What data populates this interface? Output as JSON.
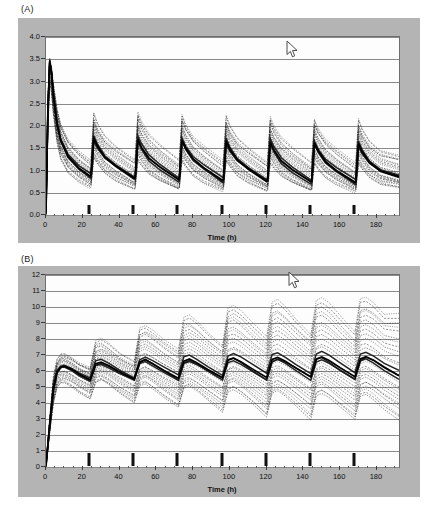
{
  "figure": {
    "background_color": "#ffffff",
    "panel_background_color": "#b4b4b4",
    "plot_background_color": "#fdfdfd",
    "grid_color": "#8a8a8a",
    "curve_color": "#1a1a1a"
  },
  "panels": {
    "a": {
      "letter": "(A)",
      "cursor": {
        "name": "mouse-pointer",
        "x": 286,
        "y": 40
      }
    },
    "b": {
      "letter": "(B)",
      "cursor": {
        "name": "mouse-pointer",
        "x": 288,
        "y": 271
      }
    }
  },
  "chart_data": [
    {
      "type": "line",
      "panel": "(A)",
      "title": "",
      "xlabel": "Time (h)",
      "ylabel": "",
      "xlim": [
        0,
        192
      ],
      "ylim": [
        0.0,
        4.0
      ],
      "xticks": [
        0,
        20,
        40,
        60,
        80,
        100,
        120,
        140,
        160,
        180
      ],
      "xticklabels": [
        "0",
        "20",
        "40",
        "60",
        "80",
        "100",
        "120",
        "140",
        "160",
        "180"
      ],
      "yticks": [
        0.0,
        0.5,
        1.0,
        1.5,
        2.0,
        2.5,
        3.0,
        3.5,
        4.0
      ],
      "yticklabels": [
        "0.0",
        "0.5",
        "1.0",
        "1.5",
        "2.0",
        "2.5",
        "3.0",
        "3.5",
        "4.0"
      ],
      "grid": true,
      "legend": "none",
      "dose_times": [
        24,
        48,
        72,
        96,
        120,
        144,
        168
      ],
      "description": "Spaghetti plot of simulated plasma concentration-time profiles; loading-dose peak near 3.5 then repeated peaks ~2.0-2.3 decaying toward 0.5-0.8 troughs.",
      "series": [
        {
          "name": "median",
          "style": "solid",
          "x": [
            0,
            1,
            2,
            3,
            4,
            6,
            8,
            12,
            18,
            24,
            24.5,
            26,
            28,
            32,
            38,
            48,
            48.5,
            50,
            52,
            56,
            62,
            72,
            72.5,
            74,
            76,
            80,
            86,
            96,
            96.5,
            98,
            100,
            104,
            110,
            120,
            120.5,
            122,
            124,
            128,
            134,
            144,
            144.5,
            146,
            148,
            152,
            158,
            168,
            168.5,
            170,
            172,
            176,
            182,
            192
          ],
          "y": [
            0.05,
            2.3,
            3.45,
            3.2,
            2.7,
            2.05,
            1.68,
            1.32,
            1.05,
            0.88,
            0.9,
            1.72,
            1.55,
            1.3,
            1.1,
            0.82,
            0.84,
            1.7,
            1.52,
            1.28,
            1.08,
            0.8,
            0.82,
            1.68,
            1.5,
            1.26,
            1.06,
            0.78,
            0.8,
            1.66,
            1.48,
            1.24,
            1.04,
            0.76,
            0.78,
            1.64,
            1.46,
            1.22,
            1.02,
            0.75,
            0.77,
            1.62,
            1.44,
            1.2,
            1.0,
            0.74,
            0.76,
            1.6,
            1.42,
            1.18,
            0.99,
            0.86
          ]
        },
        {
          "name": "upper-band",
          "style": "dashed",
          "x": [
            0,
            1,
            2,
            3,
            4,
            6,
            8,
            12,
            18,
            24,
            24.5,
            26,
            28,
            32,
            38,
            48,
            48.5,
            50,
            52,
            56,
            62,
            72,
            72.5,
            74,
            76,
            80,
            86,
            96,
            96.5,
            98,
            100,
            104,
            110,
            120,
            120.5,
            122,
            124,
            128,
            134,
            144,
            144.5,
            146,
            148,
            152,
            158,
            168,
            168.5,
            170,
            172,
            176,
            182,
            192
          ],
          "y": [
            0.07,
            2.6,
            3.5,
            3.3,
            2.95,
            2.4,
            2.05,
            1.7,
            1.42,
            1.22,
            1.24,
            2.28,
            2.05,
            1.78,
            1.55,
            1.26,
            1.28,
            2.3,
            2.08,
            1.8,
            1.56,
            1.24,
            1.26,
            2.26,
            2.04,
            1.76,
            1.54,
            1.22,
            1.24,
            2.22,
            2.0,
            1.74,
            1.52,
            1.2,
            1.22,
            2.2,
            1.98,
            1.72,
            1.5,
            1.18,
            1.2,
            2.16,
            1.95,
            1.7,
            1.48,
            1.16,
            1.18,
            2.14,
            1.92,
            1.66,
            1.45,
            1.35
          ]
        },
        {
          "name": "lower-band",
          "style": "dashed",
          "x": [
            0,
            1,
            2,
            3,
            4,
            6,
            8,
            12,
            18,
            24,
            24.5,
            26,
            28,
            32,
            38,
            48,
            48.5,
            50,
            52,
            56,
            62,
            72,
            72.5,
            74,
            76,
            80,
            86,
            96,
            96.5,
            98,
            100,
            104,
            110,
            120,
            120.5,
            122,
            124,
            128,
            134,
            144,
            144.5,
            146,
            148,
            152,
            158,
            168,
            168.5,
            170,
            172,
            176,
            182,
            192
          ],
          "y": [
            0.03,
            1.8,
            2.95,
            2.7,
            2.25,
            1.62,
            1.25,
            0.95,
            0.75,
            0.62,
            0.64,
            1.25,
            1.12,
            0.92,
            0.75,
            0.58,
            0.6,
            1.22,
            1.1,
            0.9,
            0.74,
            0.56,
            0.58,
            1.2,
            1.08,
            0.88,
            0.72,
            0.55,
            0.57,
            1.18,
            1.06,
            0.86,
            0.71,
            0.54,
            0.56,
            1.16,
            1.04,
            0.85,
            0.7,
            0.53,
            0.55,
            1.14,
            1.02,
            0.84,
            0.69,
            0.52,
            0.54,
            1.12,
            1.0,
            0.82,
            0.68,
            0.62
          ]
        }
      ]
    },
    {
      "type": "line",
      "panel": "(B)",
      "title": "",
      "xlabel": "Time (h)",
      "ylabel": "",
      "xlim": [
        0,
        192
      ],
      "ylim": [
        0,
        12
      ],
      "xticks": [
        0,
        20,
        40,
        60,
        80,
        100,
        120,
        140,
        160,
        180
      ],
      "xticklabels": [
        "0",
        "20",
        "40",
        "60",
        "80",
        "100",
        "120",
        "140",
        "160",
        "180"
      ],
      "yticks": [
        0,
        1,
        2,
        3,
        4,
        5,
        6,
        7,
        8,
        9,
        10,
        11,
        12
      ],
      "yticklabels": [
        "0",
        "1",
        "2",
        "3",
        "4",
        "5",
        "6",
        "7",
        "8",
        "9",
        "10",
        "11",
        "12"
      ],
      "grid": true,
      "legend": "none",
      "dose_times": [
        24,
        48,
        72,
        96,
        120,
        144,
        168
      ],
      "description": "Spaghetti plot of simulated effect/response-time profiles accumulating from 0 to ~6 and drifting upward with sawtooth oscillations; by 192 h the band spans roughly 3 to 10.",
      "series": [
        {
          "name": "median",
          "style": "solid",
          "x": [
            0,
            2,
            4,
            6,
            8,
            10,
            14,
            18,
            24,
            27,
            30,
            34,
            40,
            48,
            51,
            54,
            58,
            64,
            72,
            75,
            78,
            82,
            88,
            96,
            99,
            102,
            106,
            112,
            120,
            123,
            126,
            130,
            136,
            144,
            147,
            150,
            154,
            160,
            168,
            171,
            174,
            178,
            184,
            192
          ],
          "y": [
            0.1,
            2.6,
            4.9,
            5.95,
            6.25,
            6.3,
            6.1,
            5.8,
            5.45,
            6.45,
            6.55,
            6.35,
            5.95,
            5.5,
            6.55,
            6.7,
            6.45,
            6.05,
            5.55,
            6.62,
            6.75,
            6.52,
            6.1,
            5.58,
            6.68,
            6.8,
            6.58,
            6.15,
            5.6,
            6.72,
            6.85,
            6.62,
            6.18,
            5.62,
            6.74,
            6.88,
            6.65,
            6.2,
            5.64,
            6.76,
            6.9,
            6.68,
            6.22,
            5.7
          ]
        },
        {
          "name": "upper-band",
          "style": "dashed",
          "x": [
            0,
            2,
            4,
            6,
            8,
            10,
            14,
            18,
            24,
            27,
            30,
            34,
            40,
            48,
            51,
            54,
            58,
            64,
            72,
            75,
            78,
            82,
            88,
            96,
            99,
            102,
            106,
            112,
            120,
            123,
            126,
            130,
            136,
            144,
            147,
            150,
            154,
            160,
            168,
            171,
            174,
            178,
            184,
            192
          ],
          "y": [
            0.1,
            3.0,
            5.6,
            6.7,
            7.05,
            7.1,
            6.85,
            6.5,
            6.2,
            7.85,
            8.0,
            7.7,
            7.1,
            6.6,
            8.7,
            8.85,
            8.55,
            7.95,
            7.3,
            9.3,
            9.45,
            9.1,
            8.4,
            7.6,
            9.95,
            10.1,
            9.75,
            9.0,
            8.1,
            10.25,
            10.45,
            10.05,
            9.25,
            8.3,
            10.4,
            10.55,
            10.2,
            9.4,
            8.4,
            10.5,
            10.6,
            10.3,
            9.55,
            9.6
          ]
        },
        {
          "name": "lower-band",
          "style": "dashed",
          "x": [
            0,
            2,
            4,
            6,
            8,
            10,
            14,
            18,
            24,
            27,
            30,
            34,
            40,
            48,
            51,
            54,
            58,
            64,
            72,
            75,
            78,
            82,
            88,
            96,
            99,
            102,
            106,
            112,
            120,
            123,
            126,
            130,
            136,
            144,
            147,
            150,
            154,
            160,
            168,
            171,
            174,
            178,
            184,
            192
          ],
          "y": [
            0.1,
            2.1,
            3.9,
            4.9,
            5.2,
            5.25,
            5.0,
            4.65,
            4.25,
            5.25,
            5.4,
            5.1,
            4.55,
            3.95,
            5.05,
            5.2,
            4.9,
            4.35,
            3.7,
            4.85,
            5.0,
            4.7,
            4.15,
            3.4,
            4.7,
            4.85,
            4.55,
            3.95,
            3.05,
            4.55,
            4.7,
            4.4,
            3.8,
            2.95,
            4.45,
            4.6,
            4.3,
            3.7,
            2.9,
            4.35,
            4.5,
            4.2,
            3.6,
            2.95
          ]
        }
      ]
    }
  ]
}
